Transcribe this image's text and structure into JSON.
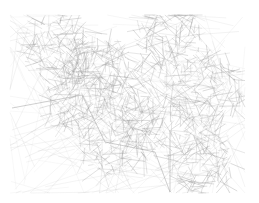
{
  "figure": {
    "title": "",
    "type": "network-graph",
    "edge_color": "#9a9a9a",
    "background": "#ffffff",
    "bounds": {
      "x": 10,
      "y": 15,
      "width": 235,
      "height": 178
    },
    "hubs": [
      {
        "x": 80,
        "y": 95
      },
      {
        "x": 115,
        "y": 140
      },
      {
        "x": 170,
        "y": 40
      },
      {
        "x": 100,
        "y": 70
      },
      {
        "x": 200,
        "y": 160
      },
      {
        "x": 60,
        "y": 50
      },
      {
        "x": 150,
        "y": 110
      },
      {
        "x": 210,
        "y": 90
      }
    ],
    "long_edges": [
      [
        12,
        108,
        82,
        95
      ],
      [
        82,
        95,
        105,
        142
      ],
      [
        105,
        142,
        155,
        152
      ],
      [
        155,
        152,
        170,
        192
      ],
      [
        170,
        130,
        170,
        192
      ]
    ]
  }
}
